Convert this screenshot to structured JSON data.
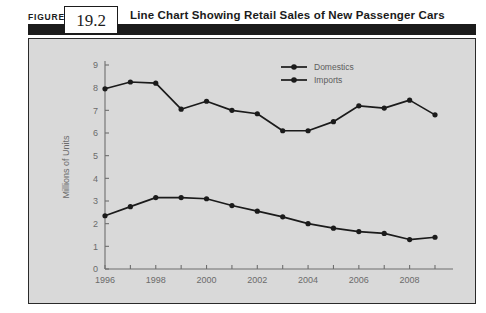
{
  "header": {
    "figure_word": "FIGURE",
    "figure_number": "19.2",
    "title": "Line Chart Showing Retail Sales of New Passenger Cars"
  },
  "chart_data": {
    "type": "line",
    "title": "",
    "xlabel": "",
    "ylabel": "Millions of Units",
    "ylim": [
      0,
      9
    ],
    "xlim": [
      1996,
      2009
    ],
    "grid": false,
    "legend_position": "top-right",
    "y_ticks": [
      "0",
      "1",
      "2",
      "3",
      "4",
      "5",
      "6",
      "7",
      "8",
      "9"
    ],
    "x_ticks_all": [
      "1996",
      "1997",
      "1998",
      "1999",
      "2000",
      "2001",
      "2002",
      "2003",
      "2004",
      "2005",
      "2006",
      "2007",
      "2008",
      "2009"
    ],
    "x_tick_labels": [
      "1996",
      "1998",
      "2000",
      "2002",
      "2004",
      "2006",
      "2008"
    ],
    "x": [
      1996,
      1997,
      1998,
      1999,
      2000,
      2001,
      2002,
      2003,
      2004,
      2005,
      2006,
      2007,
      2008,
      2009
    ],
    "series": [
      {
        "name": "Domestics",
        "values": [
          7.95,
          8.25,
          8.2,
          7.05,
          7.4,
          7.0,
          6.85,
          6.1,
          6.1,
          6.5,
          7.2,
          7.1,
          7.45,
          6.8
        ]
      },
      {
        "name": "Imports",
        "values": [
          2.35,
          2.75,
          3.15,
          3.15,
          3.1,
          2.8,
          2.55,
          2.3,
          2.0,
          1.8,
          1.65,
          1.57,
          1.3,
          1.4
        ]
      }
    ],
    "colors": {
      "series_line": "#1b1b1b",
      "axis": "#6e6e6e",
      "plot_background": "#d9d9d9",
      "header_bar": "#1b1b1b"
    }
  },
  "legend": {
    "items": [
      {
        "label": "Domestics"
      },
      {
        "label": "Imports"
      }
    ]
  }
}
